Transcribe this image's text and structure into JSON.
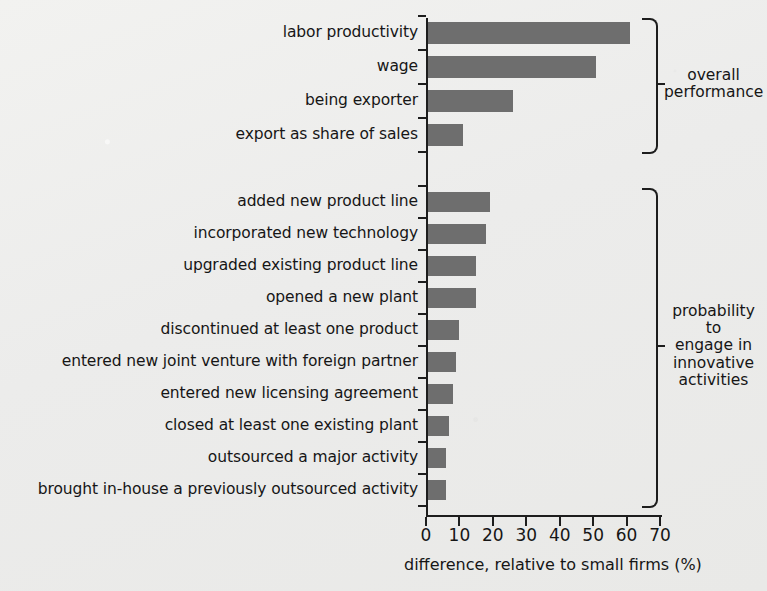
{
  "chart_data": {
    "type": "bar",
    "orientation": "horizontal",
    "title": "",
    "xlabel": "difference, relative to small firms (%)",
    "ylabel": "",
    "xlim": [
      0,
      70
    ],
    "xticks": [
      0,
      10,
      20,
      30,
      40,
      50,
      60,
      70
    ],
    "grid": false,
    "legend": "none",
    "bar_color": "#6e6e6e",
    "background_color": "#eeeeec",
    "axis_color": "#1d1d1d",
    "groups": [
      {
        "name": "overall performance",
        "bracket_label": "overall\nperformance",
        "categories": [
          "labor productivity",
          "wage",
          "being exporter",
          "export as share of sales"
        ],
        "values": [
          61,
          51,
          26,
          11
        ]
      },
      {
        "name": "probability to engage in innovative activities",
        "bracket_label": "probability to\nengage in\ninnovative\nactivities",
        "categories": [
          "added new product line",
          "incorporated new technology",
          "upgraded existing product line",
          "opened a new plant",
          "discontinued at least one product",
          "entered new joint venture with foreign partner",
          "entered new licensing agreement",
          "closed at least one existing plant",
          "outsourced a major activity",
          "brought in-house a previously outsourced activity"
        ],
        "values": [
          19,
          18,
          15,
          15,
          10,
          9,
          8,
          7,
          6,
          6
        ]
      }
    ],
    "categories": [
      "labor productivity",
      "wage",
      "being exporter",
      "export as share of sales",
      "added new product line",
      "incorporated new technology",
      "upgraded existing product line",
      "opened a new plant",
      "discontinued at least one product",
      "entered new joint venture with foreign partner",
      "entered new licensing agreement",
      "closed at least one existing plant",
      "outsourced a major activity",
      "brought in-house a previously outsourced activity"
    ],
    "values": [
      61,
      51,
      26,
      11,
      19,
      18,
      15,
      15,
      10,
      9,
      8,
      7,
      6,
      6
    ]
  },
  "layout": {
    "axis_x0_px": 426,
    "axis_x70_px": 660,
    "axis_y_top_px": 18,
    "axis_y_bottom_px": 515,
    "label_right_edge_px": 418,
    "group1_first_bar_top_px": 22,
    "group1_bar_height_px": 22,
    "group1_bar_step_px": 34,
    "group2_first_bar_top_px": 192,
    "group2_bar_height_px": 20,
    "group2_bar_step_px": 32,
    "bracket_x_px": 642,
    "bracket_text_x_px": 664,
    "x_tick_label_y_px": 527,
    "x_axis_title_x_px": 404,
    "x_axis_title_y_px": 557
  }
}
